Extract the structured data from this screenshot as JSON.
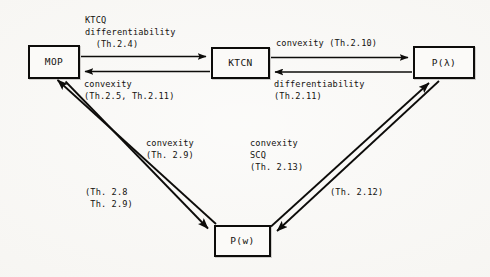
{
  "diagram": {
    "background_color": "#f7f6f3",
    "line_color": "#0d0c0a",
    "box_fill_color": "#fbfaf8",
    "nodes": [
      {
        "id": "mop",
        "label": "MOP",
        "x": 28,
        "y": 45,
        "width": 52,
        "height": 34
      },
      {
        "id": "ktcn",
        "label": "KTCN",
        "x": 211,
        "y": 47,
        "width": 59,
        "height": 32
      },
      {
        "id": "plambda",
        "label": "P(λ)",
        "x": 413,
        "y": 46,
        "width": 62,
        "height": 33
      },
      {
        "id": "pw",
        "label": "P(w)",
        "x": 214,
        "y": 225,
        "width": 57,
        "height": 32
      }
    ],
    "edges": [
      {
        "id": "mop-to-ktcn",
        "from": "mop",
        "to": "ktcn",
        "direction": "right",
        "label": "KTCQ\ndifferentiability\n  (Th.2.4)",
        "label_x": 85,
        "label_y": 14,
        "align": "left"
      },
      {
        "id": "ktcn-to-mop",
        "from": "ktcn",
        "to": "mop",
        "direction": "left",
        "label": "convexity\n(Th.2.5, Th.2.11)",
        "label_x": 84,
        "label_y": 78,
        "align": "left"
      },
      {
        "id": "ktcn-to-plambda",
        "from": "ktcn",
        "to": "plambda",
        "direction": "right",
        "label": "convexity (Th.2.10)",
        "label_x": 276,
        "label_y": 37,
        "align": "left"
      },
      {
        "id": "plambda-to-ktcn",
        "from": "plambda",
        "to": "ktcn",
        "direction": "left",
        "label": "differentiability\n(Th.2.11)",
        "label_x": 274,
        "label_y": 78,
        "align": "left"
      },
      {
        "id": "mop-to-pw",
        "from": "mop",
        "to": "pw",
        "direction": "down-right",
        "label": "convexity\n(Th. 2.9)",
        "label_x": 146,
        "label_y": 137,
        "align": "center"
      },
      {
        "id": "pw-to-mop",
        "from": "pw",
        "to": "mop",
        "direction": "up-left",
        "label": "(Th. 2.8\n Th. 2.9)",
        "label_x": 85,
        "label_y": 186,
        "align": "left"
      },
      {
        "id": "pw-to-plambda",
        "from": "pw",
        "to": "plambda",
        "direction": "up-right",
        "label": "convexity\nSCQ\n(Th. 2.13)",
        "label_x": 250,
        "label_y": 137,
        "align": "left"
      },
      {
        "id": "plambda-to-pw",
        "from": "plambda",
        "to": "pw",
        "direction": "down-left",
        "label": "(Th. 2.12)",
        "label_x": 330,
        "label_y": 186,
        "align": "left"
      }
    ]
  }
}
